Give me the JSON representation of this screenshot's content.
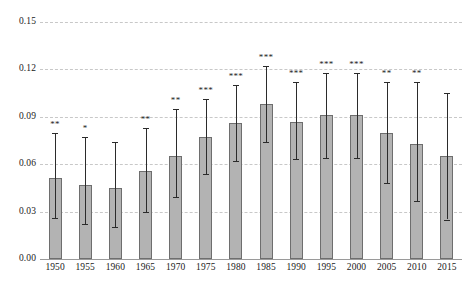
{
  "chart_data": {
    "type": "bar",
    "title": "",
    "subtitle": "",
    "xlabel": "",
    "ylabel": "",
    "ylim": [
      0.0,
      0.15
    ],
    "yticks": [
      "0.00",
      "0.03",
      "0.06",
      "0.09",
      "0.12",
      "0.15"
    ],
    "ytick_values": [
      0.0,
      0.03,
      0.06,
      0.09,
      0.12,
      0.15
    ],
    "grid": true,
    "grid_axis": "y",
    "grid_style": "dashed",
    "legend": "none",
    "error_bars": "confidence-interval",
    "categories": [
      "1950",
      "1955",
      "1960",
      "1965",
      "1970",
      "1975",
      "1980",
      "1985",
      "1990",
      "1995",
      "2000",
      "2005",
      "2010",
      "2015"
    ],
    "values": [
      0.051,
      0.047,
      0.045,
      0.056,
      0.065,
      0.077,
      0.086,
      0.098,
      0.087,
      0.091,
      0.091,
      0.08,
      0.073,
      0.065
    ],
    "ci_low": [
      0.026,
      0.022,
      0.02,
      0.03,
      0.039,
      0.054,
      0.062,
      0.074,
      0.063,
      0.064,
      0.064,
      0.048,
      0.037,
      0.025
    ],
    "ci_high": [
      0.08,
      0.077,
      0.074,
      0.083,
      0.095,
      0.101,
      0.11,
      0.122,
      0.112,
      0.118,
      0.118,
      0.112,
      0.112,
      0.105
    ],
    "significance": [
      "**",
      "*",
      "",
      "**",
      "**",
      "***",
      "***",
      "***",
      "***",
      "***",
      "***",
      "**",
      "**",
      ""
    ]
  },
  "colors": {
    "bar_fill": "#b3b3b3",
    "bar_stroke": "#6e6e6e",
    "error_bar": "#2b2b2b",
    "gridline": "#c8c8c8",
    "axis_line": "#9a9a9a",
    "text": "#1a1a1a",
    "background": "#ffffff"
  }
}
